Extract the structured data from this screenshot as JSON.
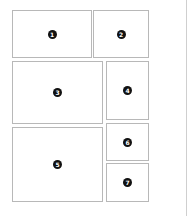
{
  "diagram": {
    "title": "",
    "panels": [
      {
        "id": "1",
        "label": "1",
        "x": 12,
        "y": 10,
        "w": 80,
        "h": 48
      },
      {
        "id": "2",
        "label": "2",
        "x": 93,
        "y": 10,
        "w": 56,
        "h": 48
      },
      {
        "id": "3",
        "label": "3",
        "x": 12,
        "y": 61,
        "w": 91,
        "h": 63
      },
      {
        "id": "4",
        "label": "4",
        "x": 106,
        "y": 61,
        "w": 43,
        "h": 59
      },
      {
        "id": "5",
        "label": "5",
        "x": 12,
        "y": 127,
        "w": 91,
        "h": 75
      },
      {
        "id": "6",
        "label": "6",
        "x": 106,
        "y": 123,
        "w": 43,
        "h": 38
      },
      {
        "id": "7",
        "label": "7",
        "x": 106,
        "y": 163,
        "w": 43,
        "h": 39
      }
    ]
  },
  "colors": {
    "border": "#b8b8b8",
    "badge": "#111111",
    "badge_text": "#ffffff"
  }
}
